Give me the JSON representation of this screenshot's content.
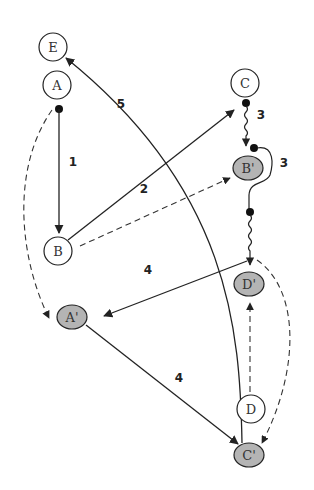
{
  "diagram": {
    "type": "graph",
    "colors": {
      "stroke": "#222222",
      "open_fill": "#ffffff",
      "shaded_fill": "#b4b4b4"
    },
    "nodes": {
      "E": {
        "label": "E",
        "style": "open"
      },
      "A": {
        "label": "A",
        "style": "open"
      },
      "C": {
        "label": "C",
        "style": "open"
      },
      "B_prime": {
        "label": "B'",
        "style": "shaded"
      },
      "B": {
        "label": "B",
        "style": "open"
      },
      "A_prime": {
        "label": "A'",
        "style": "shaded"
      },
      "D_prime": {
        "label": "D'",
        "style": "shaded"
      },
      "D": {
        "label": "D",
        "style": "open"
      },
      "C_prime": {
        "label": "C'",
        "style": "shaded"
      }
    },
    "edges": [
      {
        "from": "A",
        "to": "B",
        "style": "solid",
        "start": "dot",
        "label": "1"
      },
      {
        "from": "B",
        "to": "C",
        "style": "solid",
        "label": "2"
      },
      {
        "from": "C",
        "to": "B'",
        "style": "wavy",
        "start": "dot",
        "label": "3"
      },
      {
        "from": "B'",
        "to": "D'",
        "style": "wavy-loop",
        "start": "dot",
        "label": "3"
      },
      {
        "from": "D'",
        "to": "A'",
        "style": "solid",
        "label": "4"
      },
      {
        "from": "A'",
        "to": "C'",
        "style": "solid",
        "label": "4"
      },
      {
        "from": "C'",
        "to": "E",
        "style": "solid-curve",
        "label": "5"
      },
      {
        "from": "A",
        "to": "A'",
        "style": "dashed"
      },
      {
        "from": "B",
        "to": "B'",
        "style": "dashed"
      },
      {
        "from": "D",
        "to": "D'",
        "style": "dashed"
      },
      {
        "from": "D'",
        "to": "C'",
        "style": "dashed-curve"
      }
    ],
    "edge_labels": {
      "e1": "1",
      "e2": "2",
      "e3a": "3",
      "e3b": "3",
      "e4a": "4",
      "e4b": "4",
      "e5": "5"
    }
  }
}
